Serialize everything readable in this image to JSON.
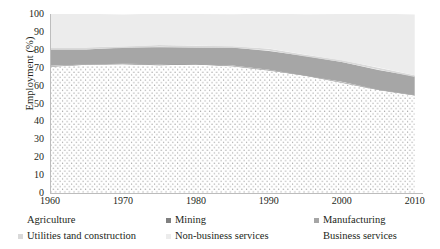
{
  "chart_data": {
    "type": "area",
    "title": "",
    "subtitle": "",
    "xlabel": "",
    "ylabel": "Employment (%)",
    "xlim": [
      1960,
      2011
    ],
    "ylim": [
      0,
      100
    ],
    "grid": false,
    "stacked": true,
    "legend_position": "bottom",
    "x_ticks": [
      "1960",
      "1970",
      "1980",
      "1990",
      "2000",
      "2010"
    ],
    "x_tick_values": [
      1960,
      1970,
      1980,
      1990,
      2000,
      2010
    ],
    "y_ticks": [
      "0",
      "10",
      "20",
      "30",
      "40",
      "50",
      "60",
      "70",
      "80",
      "90",
      "100"
    ],
    "y_tick_values": [
      0,
      10,
      20,
      30,
      40,
      50,
      60,
      70,
      80,
      90,
      100
    ],
    "x": [
      1960,
      1965,
      1970,
      1975,
      1980,
      1985,
      1990,
      1995,
      2000,
      2005,
      2010
    ],
    "series": [
      {
        "name": "Business services",
        "color": "#ffffff",
        "pattern": "dotted",
        "values": [
          70.5,
          71.5,
          71.5,
          71.5,
          71.5,
          70.5,
          68.5,
          65.0,
          61.5,
          57.5,
          54.0
        ]
      },
      {
        "name": "Manufacturing",
        "color": "#a6a6a6",
        "pattern": "solid",
        "values": [
          9.0,
          8.5,
          9.0,
          9.5,
          9.5,
          10.0,
          10.5,
          11.0,
          11.0,
          11.0,
          10.5
        ]
      },
      {
        "name": "Utilities tand construction",
        "color": "#d9d9d9",
        "pattern": "solid",
        "values": [
          1.0,
          1.0,
          1.0,
          1.0,
          1.0,
          1.0,
          1.0,
          1.0,
          1.0,
          1.0,
          1.0
        ]
      },
      {
        "name": "Non-business services",
        "color": "#ececec",
        "pattern": "solid",
        "values": [
          19.0,
          18.5,
          18.0,
          17.5,
          17.5,
          18.0,
          19.5,
          22.5,
          26.0,
          30.0,
          34.0
        ]
      },
      {
        "name": "Mining",
        "color": "#808080",
        "pattern": "solid",
        "values": [
          0.3,
          0.3,
          0.3,
          0.3,
          0.3,
          0.3,
          0.3,
          0.3,
          0.3,
          0.3,
          0.3
        ]
      },
      {
        "name": "Agriculture",
        "color": "#f2f2f2",
        "pattern": "solid",
        "values": [
          0.2,
          0.2,
          0.2,
          0.2,
          0.2,
          0.2,
          0.2,
          0.2,
          0.2,
          0.2,
          0.2
        ]
      }
    ]
  },
  "axes": {
    "y_title": "Employment (%)"
  },
  "legend": {
    "rows": [
      [
        {
          "label": "Agriculture",
          "swatch": "dotted",
          "color": "#bfbfbf"
        },
        {
          "label": "Mining",
          "swatch": "solid",
          "color": "#808080"
        },
        {
          "label": "Manufacturing",
          "swatch": "solid",
          "color": "#a6a6a6"
        }
      ],
      [
        {
          "label": "Utilities tand construction",
          "swatch": "solid",
          "color": "#d9d9d9"
        },
        {
          "label": "Non-business services",
          "swatch": "solid",
          "color": "#ececec"
        },
        {
          "label": "Business services",
          "swatch": "solid",
          "color": "#ffffff"
        }
      ]
    ]
  }
}
